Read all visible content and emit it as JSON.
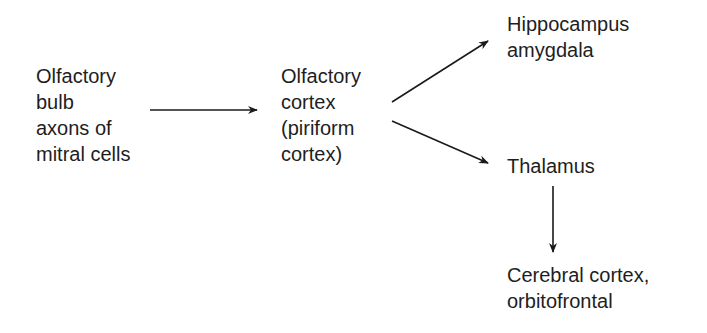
{
  "diagram": {
    "type": "flowchart",
    "text_color": "#1e1e1e",
    "arrow_color": "#1a1a1a",
    "nodes": {
      "olfactory_bulb": {
        "lines": [
          "Olfactory",
          "bulb",
          "axons of",
          "mitral cells"
        ]
      },
      "olfactory_cortex": {
        "lines": [
          "Olfactory",
          "cortex",
          "(piriform",
          "cortex)"
        ]
      },
      "hippocampus_amygdala": {
        "lines": [
          "Hippocampus",
          "amygdala"
        ]
      },
      "thalamus": {
        "lines": [
          "Thalamus"
        ]
      },
      "cerebral_cortex": {
        "lines": [
          "Cerebral cortex,",
          "orbitofrontal"
        ]
      }
    },
    "edges": [
      {
        "from": "olfactory_bulb",
        "to": "olfactory_cortex",
        "direction": "right"
      },
      {
        "from": "olfactory_cortex",
        "to": "hippocampus_amygdala",
        "direction": "up-right"
      },
      {
        "from": "olfactory_cortex",
        "to": "thalamus",
        "direction": "down-right"
      },
      {
        "from": "thalamus",
        "to": "cerebral_cortex",
        "direction": "down"
      }
    ]
  }
}
